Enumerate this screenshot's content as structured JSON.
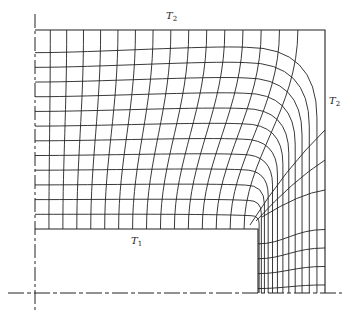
{
  "figure": {
    "type": "flux-plot",
    "labels": {
      "top_boundary": {
        "main": "T",
        "sub": "2"
      },
      "right_boundary": {
        "main": "T",
        "sub": "2"
      },
      "inner_boundary": {
        "main": "T",
        "sub": "1"
      }
    },
    "colors": {
      "line": "#222222",
      "background": "#ffffff"
    },
    "geometry": {
      "outer_left": 35,
      "outer_top": 30,
      "outer_right": 325,
      "inner_top": 229,
      "inner_right": 258,
      "baseline_y": 293,
      "axis_x": 35
    }
  }
}
